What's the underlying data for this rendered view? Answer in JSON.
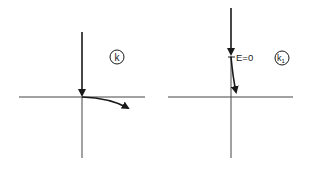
{
  "panels": [
    {
      "id": "k",
      "label": "k",
      "annotation": null
    },
    {
      "id": "k1",
      "label": "k",
      "label_subscript": "1",
      "annotation": "E=0"
    }
  ],
  "colors": {
    "ink": "#1a1a1a",
    "axis": "#333333",
    "background": "#ffffff"
  }
}
